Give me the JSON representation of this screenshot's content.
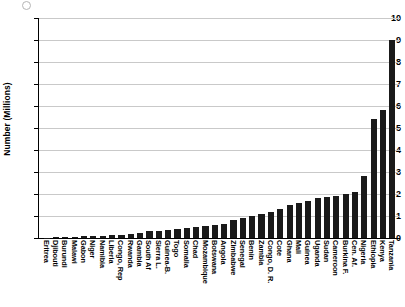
{
  "chart_data": {
    "type": "bar",
    "title": "",
    "xlabel": "",
    "ylabel": "Number (Millions)",
    "ylim": [
      0,
      10
    ],
    "ytick_labels": [
      "10",
      "9",
      "8",
      "7",
      "6",
      "5",
      "4",
      "3",
      "2",
      "1",
      "0"
    ],
    "ytick_values": [
      10,
      9,
      8,
      7,
      6,
      5,
      4,
      3,
      2,
      1,
      0
    ],
    "grid": true,
    "legend": "none",
    "categories": [
      "Eritrea",
      "Djibouti",
      "Burundi",
      "Malawi",
      "Gabon",
      "Niger",
      "Namibia",
      "Liberia",
      "Congo, Rep",
      "Rwanda",
      "Gambia",
      "South Af",
      "Sierra L.",
      "Guinea-B.",
      "Togo",
      "Somalia",
      "Chad",
      "Mozambique",
      "Botswana",
      "Angola",
      "Zimbabwe",
      "Senegal",
      "Benin",
      "Zambia",
      "Congo, D. R.",
      "Cote",
      "Ghana",
      "Mali",
      "Guinea",
      "Uganda",
      "Sudan",
      "Cameroon",
      "Burkina F.",
      "Cen. Af.",
      "Nigeria",
      "Ethiopia",
      "Kenya",
      "Tanzania"
    ],
    "values": [
      0.02,
      0.03,
      0.05,
      0.06,
      0.07,
      0.08,
      0.1,
      0.12,
      0.15,
      0.2,
      0.25,
      0.3,
      0.32,
      0.35,
      0.4,
      0.45,
      0.5,
      0.55,
      0.6,
      0.65,
      0.8,
      0.9,
      1.0,
      1.1,
      1.2,
      1.3,
      1.5,
      1.6,
      1.7,
      1.8,
      1.85,
      1.9,
      2.0,
      2.1,
      2.8,
      5.4,
      5.8,
      9.0
    ]
  }
}
